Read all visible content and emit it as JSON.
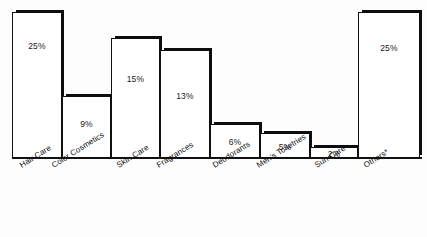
{
  "chart_data": {
    "type": "bar",
    "title": "",
    "subtitle": "",
    "xlabel": "",
    "ylabel": "",
    "ylim": [
      0,
      27
    ],
    "grid": false,
    "legend": "none",
    "orientation": "vertical",
    "value_suffix": "%",
    "categories": [
      "Hair Care",
      "Color Cosmetics",
      "Skin Care",
      "Fragrances",
      "Deodorants",
      "Men's Toiletries",
      "Sun Care",
      "Others*"
    ],
    "values": [
      25,
      9,
      15,
      13,
      6,
      5,
      2,
      25
    ],
    "labels": [
      "25%",
      "9%",
      "15%",
      "13%",
      "6%",
      "5%",
      "2%",
      "25%"
    ],
    "colors": {
      "bar_fill": "#ffffff",
      "bar_outline": "#111111",
      "bar_shadow": "#0d0d0d",
      "axis": "#111111",
      "text": "#1a1a1a",
      "background": "#fdfdfd"
    }
  },
  "bars": [
    {
      "label": "25%",
      "category": "Hair Care",
      "left": 0,
      "width": 50,
      "top": 4,
      "height": 147
    },
    {
      "label": "9%",
      "category": "Color Cosmetics",
      "left": 50,
      "width": 49,
      "top": 88,
      "height": 63
    },
    {
      "label": "15%",
      "category": "Skin Care",
      "left": 99,
      "width": 49,
      "top": 30,
      "height": 121
    },
    {
      "label": "13%",
      "category": "Fragrances",
      "left": 148,
      "width": 50,
      "top": 42,
      "height": 109
    },
    {
      "label": "6%",
      "category": "Deodorants",
      "left": 198,
      "width": 50,
      "top": 116,
      "height": 35
    },
    {
      "label": "5%",
      "category": "Men's Toiletries",
      "left": 248,
      "width": 50,
      "top": 125,
      "height": 26
    },
    {
      "label": "2%",
      "category": "Sun Care",
      "left": 298,
      "width": 48,
      "top": 139,
      "height": 12
    },
    {
      "label": "25%",
      "category": "Others*",
      "left": 346,
      "width": 62,
      "top": 4,
      "height": 147
    }
  ],
  "value_label_offsets": [
    28,
    22,
    35,
    40,
    12,
    8,
    1,
    30
  ],
  "tick_labels": [
    {
      "text": "Hair Care",
      "x": 18
    },
    {
      "text": "Color Cosmetics",
      "x": 50
    },
    {
      "text": "Skin Care",
      "x": 115
    },
    {
      "text": "Fragrances",
      "x": 155
    },
    {
      "text": "Deodorants",
      "x": 211
    },
    {
      "text": "Men's Toiletries",
      "x": 255
    },
    {
      "text": "Sun Care",
      "x": 313
    },
    {
      "text": "Others*",
      "x": 362
    }
  ]
}
